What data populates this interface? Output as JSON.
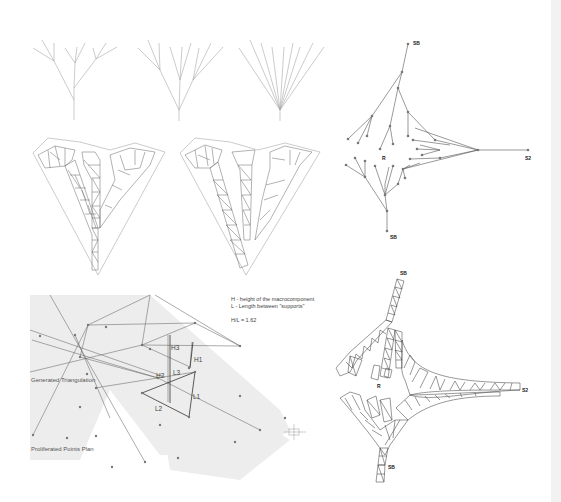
{
  "panels": {
    "top_left_trees": {
      "count": 3
    },
    "top_left_triangulations": {
      "count": 2
    },
    "top_right_graph": {
      "labels": {
        "top_support": "SB",
        "right_support": "S2",
        "bottom_support": "SB",
        "root": "R"
      }
    },
    "bottom_left_plan": {
      "legend": {
        "line1": "H - height of the macrocomponent",
        "line2": "L - Length between \"supports\"",
        "ratio": "H/L = 1.62"
      },
      "captions": {
        "triangulation": "Generated Triangulation",
        "points": "Proliferated Points Plan"
      },
      "dimensions": {
        "h1": "H1",
        "h2": "H2",
        "h3": "H3",
        "l1": "L1",
        "l2": "L2",
        "l3": "L3"
      }
    },
    "bottom_right_structure": {
      "labels": {
        "top_support": "SB",
        "right_support": "S2",
        "bottom_support": "SB",
        "root": "R"
      }
    }
  },
  "colors": {
    "line": "#555555",
    "light_line": "#9a9a9a",
    "node": "#777777",
    "shade": "#ededed"
  }
}
